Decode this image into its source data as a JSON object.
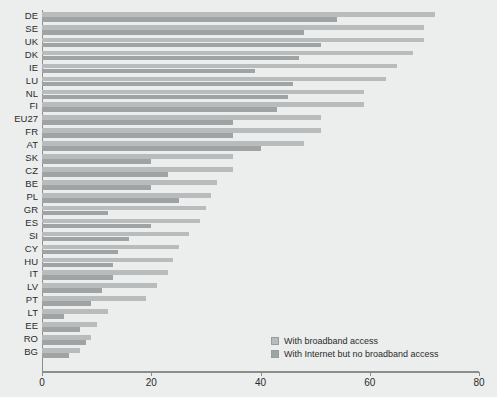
{
  "chart_data": {
    "type": "bar",
    "orientation": "horizontal",
    "title": "",
    "subtitle": "",
    "xlabel": "",
    "ylabel": "",
    "xlim": [
      0,
      80
    ],
    "xticks": [
      0,
      20,
      40,
      60,
      80
    ],
    "xticklabels": [
      "0",
      "20",
      "40",
      "60",
      "80"
    ],
    "grid": false,
    "legend_position": "inside-bottom-right",
    "categories": [
      "DE",
      "SE",
      "UK",
      "DK",
      "IE",
      "LU",
      "NL",
      "FI",
      "EU27",
      "FR",
      "AT",
      "SK",
      "CZ",
      "BE",
      "PL",
      "GR",
      "ES",
      "SI",
      "CY",
      "HU",
      "IT",
      "LV",
      "PT",
      "LT",
      "EE",
      "RO",
      "BG"
    ],
    "series": [
      {
        "name": "With broadband access",
        "color": "#b9bcbc",
        "values": [
          72,
          70,
          70,
          68,
          65,
          63,
          59,
          59,
          51,
          51,
          48,
          35,
          35,
          32,
          31,
          30,
          29,
          27,
          25,
          24,
          23,
          21,
          19,
          12,
          10,
          9,
          7
        ]
      },
      {
        "name": "With Internet but no broadband access",
        "color": "#a0a3a3",
        "values": [
          54,
          48,
          51,
          47,
          39,
          46,
          45,
          43,
          35,
          35,
          40,
          20,
          23,
          20,
          25,
          12,
          20,
          16,
          14,
          13,
          13,
          11,
          9,
          4,
          7,
          8,
          5
        ]
      }
    ],
    "legend": [
      {
        "label": "With broadband access",
        "color": "#b9bcbc",
        "swatch": "legend-swatch-broadband"
      },
      {
        "label": "With Internet but no broadband access",
        "color": "#a0a3a3",
        "swatch": "legend-swatch-no-broadband"
      }
    ],
    "colors": {
      "background": "#eceded",
      "axis": "#8b8d8d",
      "text": "#2b2b2b",
      "broadband": "#b9bcbc",
      "no_broadband": "#a0a3a3"
    }
  }
}
